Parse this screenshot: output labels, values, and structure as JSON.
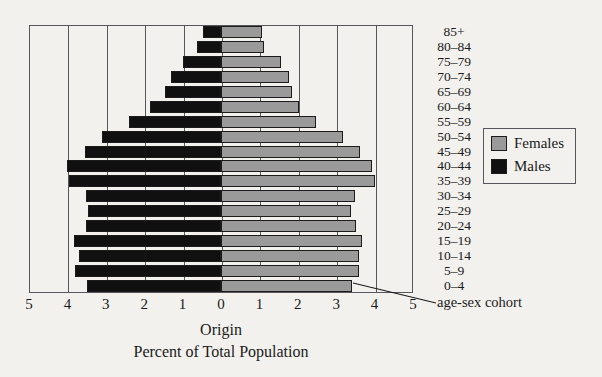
{
  "chart_data": {
    "type": "bar",
    "subtype": "population-pyramid",
    "title": "",
    "xlabel": "Percent of Total Population",
    "ylabel": "",
    "categories": [
      "0–4",
      "5–9",
      "10–14",
      "15–19",
      "20–24",
      "25–29",
      "30–34",
      "35–39",
      "40–44",
      "45–49",
      "50–54",
      "55–59",
      "60–64",
      "65–69",
      "70–74",
      "75–79",
      "80–84",
      "85+"
    ],
    "series": [
      {
        "name": "Males",
        "color": "#101010",
        "side": "left",
        "values": [
          3.5,
          3.8,
          3.7,
          3.82,
          3.52,
          3.46,
          3.52,
          3.95,
          4.0,
          3.55,
          3.1,
          2.4,
          1.85,
          1.45,
          1.3,
          1.0,
          0.62,
          0.47
        ]
      },
      {
        "name": "Females",
        "color": "#9a9a9a",
        "side": "right",
        "values": [
          3.42,
          3.6,
          3.6,
          3.68,
          3.52,
          3.38,
          3.5,
          4.0,
          3.92,
          3.62,
          3.18,
          2.48,
          2.03,
          1.85,
          1.78,
          1.55,
          1.12,
          1.07
        ]
      }
    ],
    "xlim": [
      -5,
      5
    ],
    "xticks": [
      -5,
      -4,
      -3,
      -2,
      -1,
      0,
      1,
      2,
      3,
      4,
      5
    ],
    "xtick_labels": [
      "5",
      "4",
      "3",
      "2",
      "1",
      "0",
      "1",
      "2",
      "3",
      "4",
      "5"
    ],
    "grid": true,
    "grid_axis": "x",
    "legend_position": "right"
  },
  "legend": {
    "items": [
      {
        "label": "Females",
        "color": "#9a9a9a"
      },
      {
        "label": "Males",
        "color": "#101010"
      }
    ]
  },
  "annotations": {
    "cohort_callout": "age-sex cohort"
  },
  "captions": {
    "origin": "Origin",
    "axis_title": "Percent of Total Population"
  }
}
